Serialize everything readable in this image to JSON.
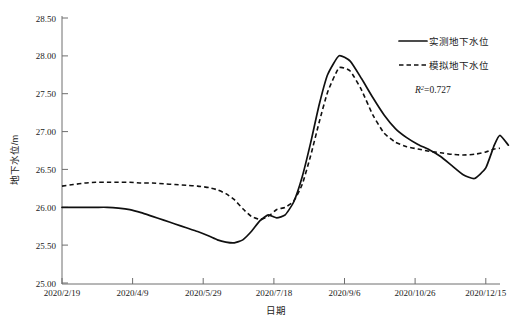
{
  "chart_data": {
    "type": "line",
    "title": "",
    "xlabel": "日期",
    "ylabel": "地下水位/m",
    "ylim": [
      25.0,
      28.5
    ],
    "ytick_labels": [
      "25.00",
      "25.50",
      "26.00",
      "26.50",
      "27.00",
      "27.50",
      "28.00",
      "28.50"
    ],
    "ytick_values": [
      25.0,
      25.5,
      26.0,
      26.5,
      27.0,
      27.5,
      28.0,
      28.5
    ],
    "xtick_labels": [
      "2020/2/19",
      "2020/4/9",
      "2020/5/29",
      "2020/7/18",
      "2020/9/6",
      "2020/10/26",
      "2020/12/15"
    ],
    "xtick_values": [
      0,
      50,
      100,
      150,
      200,
      250,
      300
    ],
    "xlim": [
      0,
      310
    ],
    "grid": false,
    "legend_position": "top-right",
    "annotations": [
      {
        "name": "r-squared",
        "symbol": "R",
        "superscript": "2",
        "equals": "=0.727",
        "value": 0.727
      }
    ],
    "series": [
      {
        "name": "实测地下水位",
        "style": "solid",
        "color": "#101010",
        "x": [
          0,
          8,
          16,
          24,
          32,
          40,
          48,
          56,
          64,
          72,
          80,
          88,
          96,
          104,
          110,
          116,
          122,
          128,
          134,
          140,
          146,
          152,
          158,
          164,
          170,
          176,
          182,
          188,
          196,
          204,
          212,
          220,
          228,
          236,
          244,
          252,
          260,
          268,
          276,
          284,
          292,
          300,
          306,
          310
        ],
        "y": [
          26.0,
          26.0,
          26.0,
          26.0,
          26.0,
          25.99,
          25.97,
          25.93,
          25.88,
          25.83,
          25.78,
          25.73,
          25.68,
          25.62,
          25.57,
          25.54,
          25.53,
          25.57,
          25.68,
          25.82,
          25.9,
          25.86,
          25.9,
          26.07,
          26.4,
          26.85,
          27.35,
          27.75,
          28.0,
          27.93,
          27.7,
          27.45,
          27.22,
          27.04,
          26.92,
          26.83,
          26.76,
          26.67,
          26.55,
          26.43,
          26.38,
          26.52,
          26.82,
          26.95
        ]
      },
      {
        "name": "模拟地下水位",
        "style": "dashed",
        "color": "#101010",
        "x": [
          0,
          8,
          16,
          24,
          32,
          40,
          48,
          56,
          64,
          72,
          80,
          88,
          96,
          104,
          110,
          116,
          122,
          128,
          134,
          140,
          146,
          152,
          158,
          164,
          170,
          176,
          182,
          188,
          196,
          204,
          212,
          220,
          228,
          236,
          244,
          252,
          260,
          268,
          276,
          284,
          292,
          300,
          306,
          310
        ],
        "y": [
          26.28,
          26.3,
          26.32,
          26.33,
          26.33,
          26.33,
          26.33,
          26.32,
          26.32,
          26.31,
          26.3,
          26.29,
          26.28,
          26.26,
          26.23,
          26.18,
          26.1,
          25.98,
          25.88,
          25.84,
          25.88,
          25.97,
          26.0,
          26.08,
          26.3,
          26.68,
          27.12,
          27.52,
          27.84,
          27.8,
          27.55,
          27.22,
          26.98,
          26.86,
          26.8,
          26.77,
          26.74,
          26.72,
          26.7,
          26.69,
          26.7,
          26.73,
          26.77,
          26.78
        ]
      }
    ],
    "observed_tail": {
      "x": [
        310,
        316
      ],
      "y": [
        26.95,
        26.82
      ]
    }
  },
  "legend": {
    "items": [
      {
        "label": "实测地下水位",
        "style": "solid",
        "icon": "solid-line-swatch"
      },
      {
        "label": "模拟地下水位",
        "style": "dashed",
        "icon": "dashed-line-swatch"
      }
    ]
  }
}
